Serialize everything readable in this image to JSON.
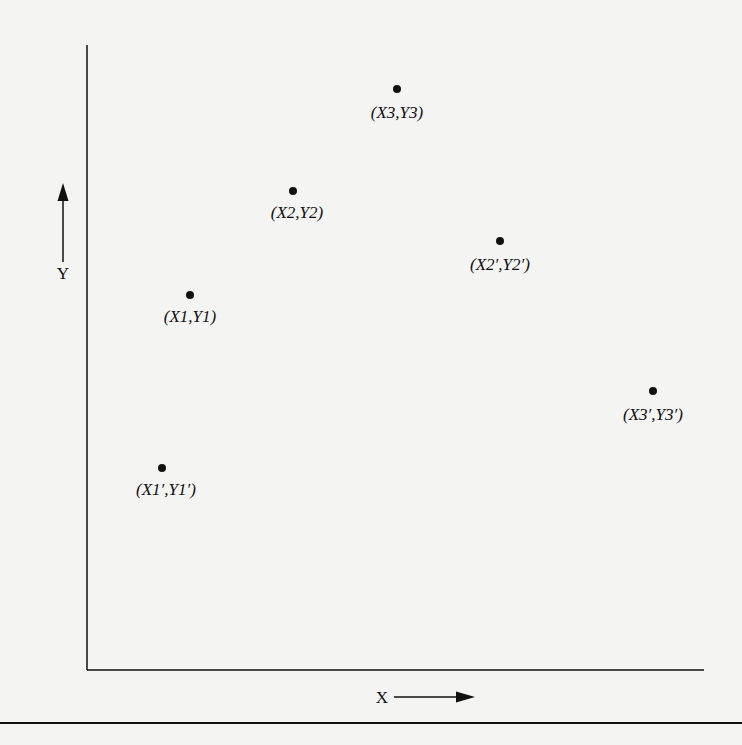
{
  "figure": {
    "axes": {
      "x_label": "X",
      "y_label": "Y"
    },
    "points": [
      {
        "id": "p3",
        "label": "(X3,Y3)",
        "dot": [
          397,
          89
        ],
        "text": [
          397,
          104
        ]
      },
      {
        "id": "p2",
        "label": "(X2,Y2)",
        "dot": [
          293,
          191
        ],
        "text": [
          297,
          204
        ]
      },
      {
        "id": "p2p",
        "label": "(X2′,Y2′)",
        "dot": [
          500,
          241
        ],
        "text": [
          500,
          256
        ]
      },
      {
        "id": "p1",
        "label": "(X1,Y1)",
        "dot": [
          190,
          295
        ],
        "text": [
          190,
          308
        ]
      },
      {
        "id": "p3p",
        "label": "(X3′,Y3′)",
        "dot": [
          653,
          391
        ],
        "text": [
          653,
          406
        ]
      },
      {
        "id": "p1p",
        "label": "(X1′,Y1′)",
        "dot": [
          162,
          468
        ],
        "text": [
          166,
          481
        ]
      }
    ],
    "colors": {
      "ink": "#111111",
      "paper": "#f4f4f2"
    }
  }
}
